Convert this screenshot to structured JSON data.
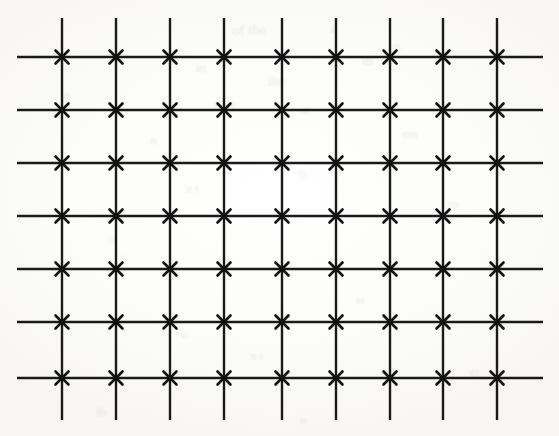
{
  "figure": {
    "type": "diagram",
    "width": 559,
    "height": 436,
    "background_color": "#fdfdfb",
    "line_color": "#1a1a1a",
    "mark_color": "#111111",
    "line_width": 2.4,
    "mark_stroke_width": 2.6,
    "mark_arm_length": 6.5,
    "grid": {
      "vertical_line_count": 9,
      "horizontal_line_count": 7,
      "intersection_count": 63,
      "vertical_spacing_px": 54,
      "horizontal_spacing_px": 53,
      "vertical_x": [
        62,
        116,
        170,
        224,
        282,
        336,
        390,
        443,
        497
      ],
      "horizontal_y": [
        57,
        110,
        163,
        216,
        269,
        322,
        378
      ],
      "vertical_extent": {
        "y_start": 18,
        "y_end": 420
      },
      "horizontal_extent": {
        "x_start": 17,
        "x_end": 543
      }
    },
    "marks": {
      "shape": "x-cross",
      "label": "intersection-cross-mark",
      "placed_at": "every vertical-horizontal intersection"
    },
    "bleedthrough": [
      {
        "text": "of the",
        "x": 232,
        "y": 22,
        "size": 15,
        "rotate": -1.5
      },
      {
        "text": "a",
        "x": 330,
        "y": 18,
        "size": 17,
        "rotate": 2
      },
      {
        "text": "in",
        "x": 196,
        "y": 60,
        "size": 13,
        "rotate": 0
      },
      {
        "text": "the",
        "x": 268,
        "y": 74,
        "size": 14,
        "rotate": -2
      },
      {
        "text": "m",
        "x": 362,
        "y": 52,
        "size": 15,
        "rotate": 1
      },
      {
        "text": "of a",
        "x": 214,
        "y": 96,
        "size": 14,
        "rotate": 0
      },
      {
        "text": "ur",
        "x": 300,
        "y": 102,
        "size": 13,
        "rotate": -1
      },
      {
        "text": "n",
        "x": 150,
        "y": 132,
        "size": 13,
        "rotate": 0
      },
      {
        "text": "ess",
        "x": 402,
        "y": 126,
        "size": 13,
        "rotate": 1
      },
      {
        "text": "a t",
        "x": 186,
        "y": 180,
        "size": 13,
        "rotate": 0
      },
      {
        "text": "ro",
        "x": 448,
        "y": 196,
        "size": 13,
        "rotate": -1
      },
      {
        "text": "e",
        "x": 120,
        "y": 250,
        "size": 13,
        "rotate": 0
      },
      {
        "text": "is",
        "x": 356,
        "y": 292,
        "size": 13,
        "rotate": 0
      },
      {
        "text": "n t",
        "x": 250,
        "y": 348,
        "size": 13,
        "rotate": 1
      },
      {
        "text": "er",
        "x": 470,
        "y": 364,
        "size": 13,
        "rotate": 0
      },
      {
        "text": "th",
        "x": 96,
        "y": 404,
        "size": 13,
        "rotate": 0
      },
      {
        "text": "o",
        "x": 300,
        "y": 412,
        "size": 13,
        "rotate": 0
      }
    ]
  }
}
